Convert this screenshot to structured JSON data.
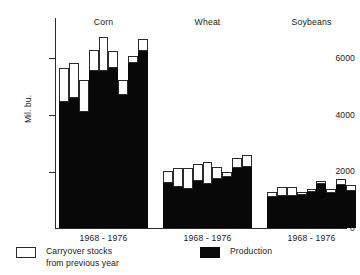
{
  "chart_data": {
    "type": "bar",
    "title": "",
    "subtitle": "",
    "xlabel": "",
    "ylabel": "Mil. bu.",
    "ylim": [
      0,
      7400
    ],
    "yticks": [
      0,
      2000,
      4000,
      6000
    ],
    "ytick_labels": [
      "0",
      "2000",
      "4000",
      "6000"
    ],
    "grid": false,
    "stacked": true,
    "legend_position": "bottom",
    "x": [
      1968,
      1969,
      1970,
      1971,
      1972,
      1973,
      1974,
      1975,
      1976
    ],
    "categories": [
      "Corn",
      "Wheat",
      "Soybeans"
    ],
    "series": [
      {
        "name": "Production",
        "color": "#080808"
      },
      {
        "name": "Carryover stocks from previous year",
        "color": "#ffffff"
      }
    ],
    "groups": [
      {
        "name": "Corn",
        "range_label": "1968 - 1976",
        "bars": [
          {
            "year": 1968,
            "production": 4450,
            "carryover": 1200,
            "total": 5650
          },
          {
            "year": 1969,
            "production": 4580,
            "carryover": 1230,
            "total": 5810
          },
          {
            "year": 1970,
            "production": 4100,
            "carryover": 1100,
            "total": 5200
          },
          {
            "year": 1971,
            "production": 5540,
            "carryover": 740,
            "total": 6280
          },
          {
            "year": 1972,
            "production": 5550,
            "carryover": 1170,
            "total": 6720
          },
          {
            "year": 1973,
            "production": 5650,
            "carryover": 580,
            "total": 6230
          },
          {
            "year": 1974,
            "production": 4700,
            "carryover": 500,
            "total": 5200
          },
          {
            "year": 1975,
            "production": 5800,
            "carryover": 270,
            "total": 6070
          },
          {
            "year": 1976,
            "production": 6250,
            "carryover": 400,
            "total": 6650
          }
        ]
      },
      {
        "name": "Wheat",
        "range_label": "1968 - 1976",
        "bars": [
          {
            "year": 1968,
            "production": 1570,
            "carryover": 430,
            "total": 2000
          },
          {
            "year": 1969,
            "production": 1460,
            "carryover": 660,
            "total": 2120
          },
          {
            "year": 1970,
            "production": 1380,
            "carryover": 740,
            "total": 2120
          },
          {
            "year": 1971,
            "production": 1640,
            "carryover": 620,
            "total": 2260
          },
          {
            "year": 1972,
            "production": 1550,
            "carryover": 760,
            "total": 2310
          },
          {
            "year": 1973,
            "production": 1710,
            "carryover": 450,
            "total": 2160
          },
          {
            "year": 1974,
            "production": 1800,
            "carryover": 190,
            "total": 1990
          },
          {
            "year": 1975,
            "production": 2120,
            "carryover": 330,
            "total": 2450
          },
          {
            "year": 1976,
            "production": 2150,
            "carryover": 440,
            "total": 2590
          }
        ]
      },
      {
        "name": "Soybeans",
        "range_label": "1968 - 1976",
        "bars": [
          {
            "year": 1968,
            "production": 1100,
            "carryover": 170,
            "total": 1270
          },
          {
            "year": 1969,
            "production": 1120,
            "carryover": 320,
            "total": 1440
          },
          {
            "year": 1970,
            "production": 1130,
            "carryover": 320,
            "total": 1450
          },
          {
            "year": 1971,
            "production": 1180,
            "carryover": 100,
            "total": 1280
          },
          {
            "year": 1972,
            "production": 1280,
            "carryover": 110,
            "total": 1390
          },
          {
            "year": 1973,
            "production": 1550,
            "carryover": 90,
            "total": 1640
          },
          {
            "year": 1974,
            "production": 1220,
            "carryover": 170,
            "total": 1390
          },
          {
            "year": 1975,
            "production": 1520,
            "carryover": 190,
            "total": 1710
          },
          {
            "year": 1976,
            "production": 1290,
            "carryover": 230,
            "total": 1520
          }
        ]
      }
    ]
  },
  "axis": {
    "y_label": "Mil. bu.",
    "tick_6000": "6000",
    "tick_4000": "4000",
    "tick_2000": "2000",
    "tick_0": "0"
  },
  "groups_text": {
    "corn_title": "Corn",
    "corn_xlabel": "1968 - 1976",
    "wheat_title": "Wheat",
    "wheat_xlabel": "1968 - 1976",
    "soybeans_title": "Soybeans",
    "soybeans_xlabel": "1968 - 1976"
  },
  "legend": {
    "carryover_label": "Carryover stocks\nfrom previous year",
    "production_label": "Production"
  }
}
